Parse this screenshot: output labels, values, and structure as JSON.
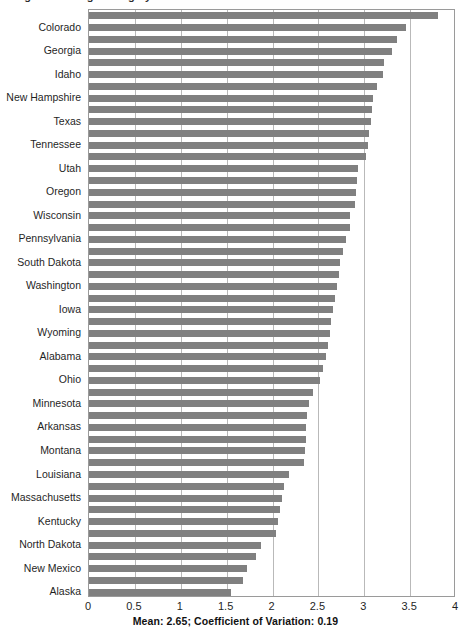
{
  "chart_data": {
    "type": "bar",
    "orientation": "horizontal",
    "title": "",
    "xlabel": "",
    "ylabel": "",
    "xlim": [
      0,
      4
    ],
    "grid": true,
    "legend": false,
    "bar_color": "#808080",
    "xticks": [
      "0",
      "0.5",
      "1",
      "1.5",
      "2",
      "2.5",
      "3",
      "3.5",
      "4"
    ],
    "xtick_values": [
      0,
      0.5,
      1,
      1.5,
      2,
      2.5,
      3,
      3.5,
      4
    ],
    "categories": [
      "",
      "Colorado",
      "",
      "Georgia",
      "",
      "Idaho",
      "",
      "New Hampshire",
      "",
      "Texas",
      "",
      "Tennessee",
      "",
      "Utah",
      "",
      "Oregon",
      "",
      "Wisconsin",
      "",
      "Pennsylvania",
      "",
      "South Dakota",
      "",
      "Washington",
      "",
      "Iowa",
      "",
      "Wyoming",
      "",
      "Alabama",
      "",
      "Ohio",
      "",
      "Minnesota",
      "",
      "Arkansas",
      "",
      "Montana",
      "",
      "Louisiana",
      "",
      "Massachusetts",
      "",
      "Kentucky",
      "",
      "North Dakota",
      "",
      "New Mexico",
      "",
      "Alaska"
    ],
    "values": [
      3.8,
      3.45,
      3.36,
      3.3,
      3.22,
      3.2,
      3.14,
      3.1,
      3.08,
      3.07,
      3.05,
      3.04,
      3.02,
      2.93,
      2.92,
      2.91,
      2.9,
      2.85,
      2.84,
      2.8,
      2.77,
      2.74,
      2.72,
      2.7,
      2.68,
      2.66,
      2.64,
      2.63,
      2.6,
      2.58,
      2.55,
      2.52,
      2.44,
      2.4,
      2.38,
      2.37,
      2.36,
      2.35,
      2.34,
      2.18,
      2.13,
      2.1,
      2.08,
      2.06,
      2.04,
      1.87,
      1.82,
      1.72,
      1.68,
      1.55
    ],
    "labeled_indices": [
      1,
      3,
      5,
      7,
      9,
      11,
      13,
      15,
      17,
      19,
      21,
      23,
      25,
      27,
      29,
      31,
      33,
      35,
      37,
      39,
      41,
      43,
      45,
      47,
      49
    ],
    "annotation": "Mean:  2.65; Coefficient of Variation:  0.19",
    "mean": 2.65,
    "coefficient_of_variation": 0.19,
    "bar_count": 50
  },
  "cropped_title": "Figure: Average rating by state"
}
